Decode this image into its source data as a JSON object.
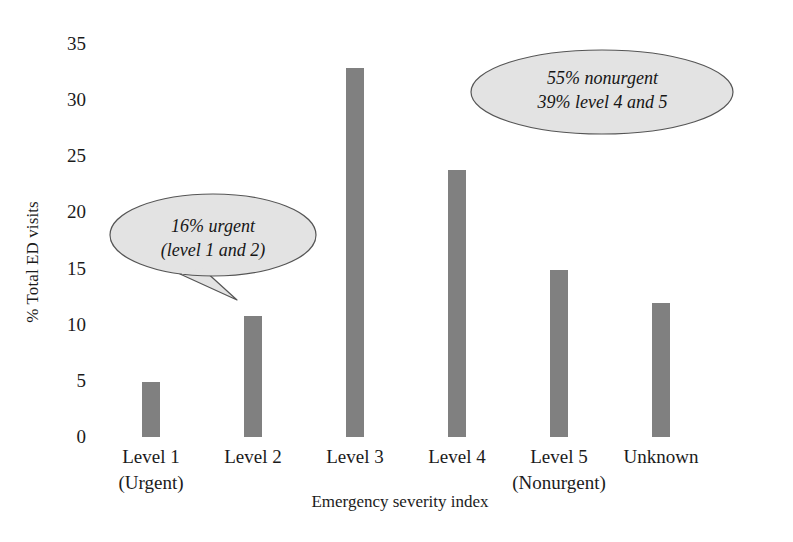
{
  "chart_data": {
    "type": "bar",
    "title": "",
    "xlabel": "Emergency severity index",
    "ylabel": "% Total ED visits",
    "categories": [
      "Level 1 (Urgent)",
      "Level 2",
      "Level 3",
      "Level 4",
      "Level 5 (Nonurgent)",
      "Unknown"
    ],
    "category_lines": [
      [
        "Level 1",
        "(Urgent)"
      ],
      [
        "Level 2",
        ""
      ],
      [
        "Level 3",
        ""
      ],
      [
        "Level 4",
        ""
      ],
      [
        "Level 5",
        "(Nonurgent)"
      ],
      [
        "Unknown",
        ""
      ]
    ],
    "values": [
      4.9,
      10.8,
      32.9,
      23.8,
      14.9,
      11.9
    ],
    "ylim": [
      0,
      35
    ],
    "ytick_values": [
      0,
      5,
      10,
      15,
      20,
      25,
      30,
      35
    ],
    "ytick_labels": [
      "0",
      "5",
      "10",
      "15",
      "20",
      "25",
      "30",
      "35"
    ],
    "grid": false,
    "legend": "none",
    "bar_color": "#808080",
    "annotations": [
      {
        "id": "urgent",
        "shape": "speech-bubble-ellipse",
        "lines": [
          "16% urgent",
          "(level 1 and 2)"
        ],
        "fill_color": "#e3e3e3",
        "stroke_color": "#555555",
        "points_to": "Level 1 / Level 2 bars"
      },
      {
        "id": "nonurgent",
        "shape": "ellipse",
        "lines": [
          "55% nonurgent",
          "39% level 4 and 5"
        ],
        "fill_color": "#e3e3e3",
        "stroke_color": "#555555",
        "points_to": ""
      }
    ]
  },
  "axes": {
    "y_title": "% Total ED visits",
    "x_title": "Emergency severity index"
  }
}
